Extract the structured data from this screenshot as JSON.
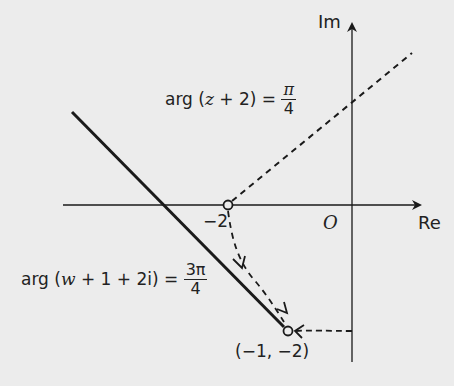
{
  "diagram": {
    "axes": {
      "real_label": "Re",
      "imag_label": "Im",
      "origin_label": "O"
    },
    "points": {
      "minus_two_label": "−2",
      "w_point_label": "(−1, −2)"
    },
    "equation_z": {
      "lhs_prefix": "arg (",
      "variable": "z",
      "lhs_suffix": " + 2) = ",
      "numerator": "π",
      "denominator": "4"
    },
    "equation_w": {
      "lhs_prefix": "arg (",
      "variable": "w",
      "lhs_suffix": " + 1 + 2i) = ",
      "numerator": "3π",
      "denominator": "4"
    },
    "colors": {
      "line": "#1a1a1a",
      "background": "#ececec"
    }
  }
}
